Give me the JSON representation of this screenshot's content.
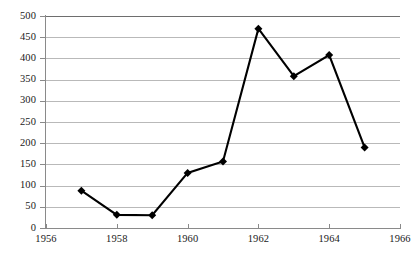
{
  "chart_data": {
    "type": "line",
    "title": "",
    "subtitle": "",
    "xlabel": "",
    "ylabel": "",
    "x": [
      1957,
      1958,
      1959,
      1960,
      1961,
      1962,
      1963,
      1964,
      1965
    ],
    "values": [
      88,
      31,
      30,
      130,
      157,
      470,
      358,
      408,
      190
    ],
    "series": [
      {
        "name": "",
        "x": [
          1957,
          1958,
          1959,
          1960,
          1961,
          1962,
          1963,
          1964,
          1965
        ],
        "values": [
          88,
          31,
          30,
          130,
          157,
          470,
          358,
          408,
          190
        ]
      }
    ],
    "xlim": [
      1956,
      1966
    ],
    "ylim": [
      0,
      500
    ],
    "x_ticks": [
      1956,
      1958,
      1960,
      1962,
      1964,
      1966
    ],
    "x_tick_labels": [
      "1956",
      "1958",
      "1960",
      "1962",
      "1964",
      "1966"
    ],
    "y_ticks": [
      0,
      50,
      100,
      150,
      200,
      250,
      300,
      350,
      400,
      450,
      500
    ],
    "y_tick_labels": [
      "0",
      "50",
      "100",
      "150",
      "200",
      "250",
      "300",
      "350",
      "400",
      "450",
      "500"
    ],
    "grid": true,
    "grid_axis": "y",
    "legend": false,
    "legend_position": "none",
    "marker": "diamond",
    "line_color": "#000000",
    "marker_color": "#000000",
    "grid_color": "#b9b9b9",
    "axis_color": "#8a8a8a",
    "background_color": "#ffffff"
  }
}
